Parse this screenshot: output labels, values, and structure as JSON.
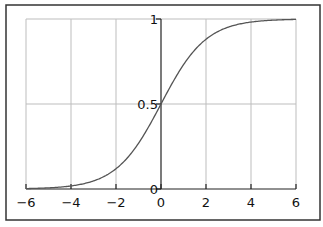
{
  "chart_data": {
    "type": "line",
    "title": "",
    "xlabel": "",
    "ylabel": "",
    "xlim": [
      -6,
      6
    ],
    "ylim": [
      0,
      1
    ],
    "grid": true,
    "legend": null,
    "x_ticks": [
      -6,
      -4,
      -2,
      0,
      2,
      4,
      6
    ],
    "x_tick_labels": [
      "−6",
      "−4",
      "−2",
      "0",
      "2",
      "4",
      "6"
    ],
    "y_ticks": [
      0,
      0.5,
      1
    ],
    "y_tick_labels": [
      "0",
      "0.5",
      "1"
    ],
    "series": [
      {
        "name": "sigmoid",
        "function": "1/(1+exp(-x))",
        "x": [
          -6,
          -5,
          -4,
          -3,
          -2,
          -1,
          0,
          1,
          2,
          3,
          4,
          5,
          6
        ],
        "y": [
          0.0025,
          0.0067,
          0.018,
          0.047,
          0.119,
          0.269,
          0.5,
          0.731,
          0.881,
          0.953,
          0.982,
          0.9933,
          0.9975
        ]
      }
    ],
    "colors": {
      "curve": "#555555",
      "grid": "#bdbdbd",
      "axis": "#222222",
      "frame": "#333333"
    }
  }
}
